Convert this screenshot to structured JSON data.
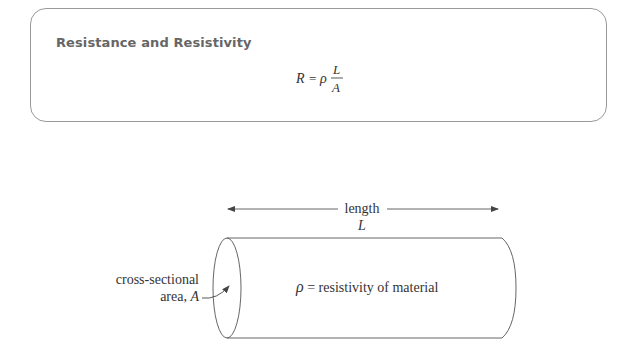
{
  "formula_card": {
    "title": "Resistance and Resistivity",
    "formula": {
      "lhs": "R",
      "equals": "=",
      "coefficient": "ρ",
      "numerator": "L",
      "denominator": "A"
    }
  },
  "diagram": {
    "length_label": "length",
    "length_symbol": "L",
    "area_label_line1": "cross-sectional",
    "area_label_line2": "area, ",
    "area_symbol": "A",
    "resistivity_symbol": "ρ",
    "resistivity_label": " = resistivity of material"
  },
  "colors": {
    "stroke": "#555555",
    "box_border": "#9a9a9a",
    "title": "#666666",
    "text": "#333333"
  }
}
